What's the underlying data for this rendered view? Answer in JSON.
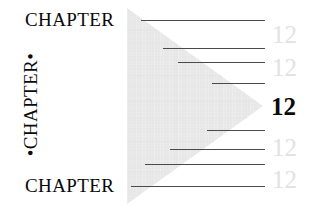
{
  "page": {
    "width": 314,
    "height": 212,
    "background_color": "#ffffff"
  },
  "chapter_labels": {
    "top": "CHAPTER",
    "bottom": "CHAPTER",
    "vertical": "•CHAPTER•",
    "color": "#0a0a0a"
  },
  "triangle": {
    "fill_color": "#e9e9e9",
    "texture": "crosshatch-weave",
    "points": "127,8 127,204 263,106"
  },
  "rules": {
    "color": "#4a4a4a",
    "items": [
      {
        "x": 141,
        "y": 20,
        "width": 124
      },
      {
        "x": 163,
        "y": 48,
        "width": 102
      },
      {
        "x": 178,
        "y": 62,
        "width": 87
      },
      {
        "x": 212,
        "y": 83,
        "width": 53
      },
      {
        "x": 207,
        "y": 130,
        "width": 58
      },
      {
        "x": 170,
        "y": 149,
        "width": 95
      },
      {
        "x": 145,
        "y": 164,
        "width": 120
      },
      {
        "x": 131,
        "y": 186,
        "width": 134
      }
    ]
  },
  "folios": {
    "ghost_color": "#e2e2e2",
    "main_color": "#0a0a0a",
    "items": [
      {
        "value": "12",
        "x": 272,
        "y": 22,
        "style": "ghost"
      },
      {
        "value": "12",
        "x": 272,
        "y": 55,
        "style": "ghost"
      },
      {
        "value": "12",
        "x": 271,
        "y": 94,
        "style": "main"
      },
      {
        "value": "12",
        "x": 272,
        "y": 135,
        "style": "ghost"
      },
      {
        "value": "12",
        "x": 272,
        "y": 167,
        "style": "ghost"
      }
    ]
  }
}
